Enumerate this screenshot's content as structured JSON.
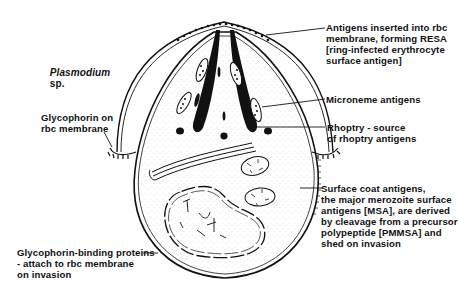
{
  "diagram": {
    "title": "Plasmodium sp.",
    "title_species": "Plasmodium",
    "title_suffix": "sp.",
    "colors": {
      "ink": "#111111",
      "background": "#ffffff",
      "stipple": "#555555"
    },
    "labels": [
      {
        "id": "resa",
        "text": "Antigens inserted into rbc\nmembrane, forming RESA\n[ring-infected erythrocyte\nsurface antigen]"
      },
      {
        "id": "microneme",
        "text": "Microneme antigens"
      },
      {
        "id": "rhoptry",
        "text": "Rhoptry - source\nof rhoptry antigens"
      },
      {
        "id": "glycophorin",
        "text": "Glycophorin on\nrbc membrane"
      },
      {
        "id": "surface-coat",
        "text": "Surface coat antigens,\nthe major merozoite surface\nantigens [MSA], are derived\nby cleavage from a precursor\npolypeptide [PMMSA] and\nshed on invasion"
      },
      {
        "id": "glycophorin-binding",
        "text": "Glycophorin-binding proteins\n- attach to rbc membrane\non invasion"
      }
    ],
    "nodes": [
      {
        "id": "rbc-membrane",
        "label": "rbc membrane"
      },
      {
        "id": "merozoite",
        "label": "Merozoite"
      },
      {
        "id": "rhoptries",
        "label": "Rhoptries"
      },
      {
        "id": "micronemes",
        "label": "Micronemes"
      },
      {
        "id": "mitochondria",
        "label": "Mitochondria"
      },
      {
        "id": "nucleus",
        "label": "Nucleus"
      },
      {
        "id": "er",
        "label": "Endoplasmic reticulum"
      }
    ]
  }
}
